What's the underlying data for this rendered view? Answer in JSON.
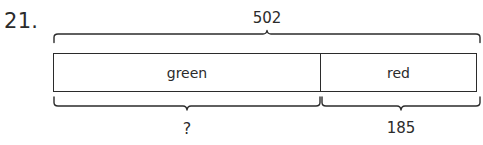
{
  "problem": {
    "number": "21."
  },
  "bar_model": {
    "total_label": "502",
    "segments": [
      {
        "name": "green",
        "label": "green",
        "value_label": "?"
      },
      {
        "name": "red",
        "label": "red",
        "value_label": "185"
      }
    ],
    "unknown_label": "?",
    "known_label": "185",
    "stroke_color": "#2b2b2b",
    "fill_color": "#ffffff"
  },
  "braces": {
    "total": {
      "name": "total-brace",
      "spans": "whole-bar"
    },
    "unknown": {
      "name": "unknown-brace",
      "spans": "green-segment"
    },
    "known": {
      "name": "known-brace",
      "spans": "red-segment"
    }
  }
}
